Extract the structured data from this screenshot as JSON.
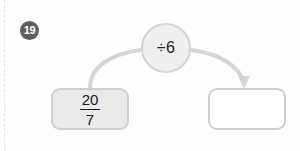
{
  "worksheet": {
    "question_number": "19",
    "operator_circle": {
      "label": "÷6",
      "icon": "divide-icon",
      "fill_color": "#efefef",
      "border_color": "#d2d2d2"
    },
    "input_box": {
      "value_numerator": "20",
      "value_denominator": "7",
      "display": "20/7",
      "fill_color": "#e9e9e9",
      "border_color": "#cfcfcf"
    },
    "output_box": {
      "value": "",
      "fill_color": "#ffffff",
      "border_color": "#cfcfcf"
    },
    "connectors": {
      "input_to_operator": "curved-line",
      "operator_to_output": "curved-arrow",
      "stroke_color": "#d5d5d5"
    },
    "badge": {
      "background_color": "#5e5e5e",
      "text_color": "#ffffff"
    }
  }
}
